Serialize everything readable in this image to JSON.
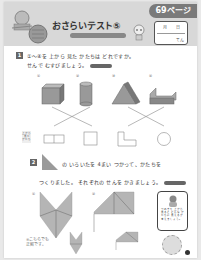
{
  "header": {
    "page_tab": "69ページ",
    "title": "おさらいテスト⑤",
    "subtitle": "",
    "date_box": {
      "month_day": "月 日",
      "score_unit": "てん"
    }
  },
  "question1": {
    "number": "1",
    "line1": "①〜④を 上から 見た かたちは どれですか。",
    "line2": "せんで むすびましょう。",
    "labels": [
      "①",
      "②",
      "③",
      "④"
    ],
    "side_label": "上から 見た かたち",
    "solids": [
      "cube",
      "cylinder",
      "triangular-prism",
      "L-prism"
    ],
    "top_views": [
      "divided-rectangle",
      "square",
      "L-shape",
      "circle"
    ]
  },
  "question2": {
    "number": "2",
    "line1": "の いろいたを 4まい つかって、かたちを",
    "line2": "つくりました。 それぞれの せんを かきましょう。",
    "labels": [
      "①",
      "②"
    ],
    "answer_note_line1": "※こちらでも",
    "answer_note_line2": "正解です。"
  },
  "note_box": {
    "text": "つみきを 上から 見ると どんな かたちに 見えるか 考えましょう。"
  },
  "colors": {
    "header_bg": "#d8d8d8",
    "tab_bg": "#7a7a7a",
    "shape_fill": "#9a9a9a",
    "tan_fill": "#b5b5b5"
  }
}
